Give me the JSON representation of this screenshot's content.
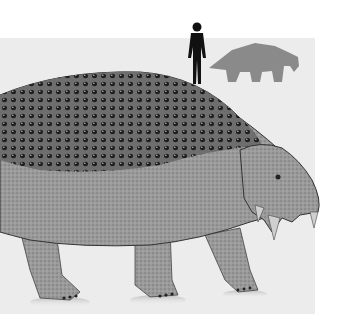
{
  "image": {
    "description": "Scutosaurus life restoration with human-for-scale silhouette",
    "subject": "armored pareiasaur reptile (grayscale illustration)",
    "scale_figures": [
      "human-silhouette",
      "animal-silhouette"
    ],
    "colors": {
      "background": "#ffffff",
      "panel": "#ececec",
      "human_silhouette": "#111111",
      "animal_silhouette": "#8a8a8a",
      "body_dark": "#3a3a3a",
      "body_mid": "#8c8c8c",
      "body_light": "#b4b4b4"
    }
  }
}
